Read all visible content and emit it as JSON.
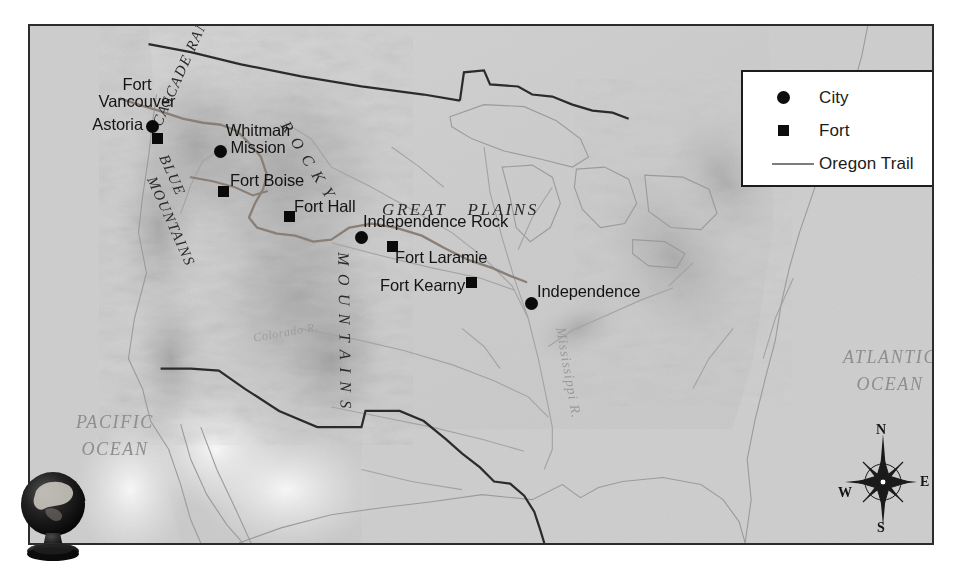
{
  "map": {
    "title": "Oregon Trail Map",
    "background_color": "#cfcfcf",
    "border_color": "#2c2c2c",
    "trail_color": "#8a7f74",
    "boundary_color": "#2b2b2b"
  },
  "legend": {
    "title": "Map Legend",
    "border_color": "#1c1c1c",
    "items": [
      {
        "symbol": "city-dot-icon",
        "label": "City"
      },
      {
        "symbol": "fort-square-icon",
        "label": "Fort"
      },
      {
        "symbol": "trail-line-icon",
        "label": "Oregon Trail"
      }
    ]
  },
  "places": [
    {
      "name": "Fort Vancouver",
      "type": "fort",
      "label": "Fort\nVancouver",
      "label_x": 62,
      "label_y": 50,
      "label_w": 90,
      "label_align": "c",
      "marker_x": 122,
      "marker_y": 107
    },
    {
      "name": "Astoria",
      "type": "city",
      "label": "Astoria",
      "label_x": 47,
      "label_y": 90,
      "label_w": 66,
      "label_align": "r",
      "marker_x": 116,
      "marker_y": 94
    },
    {
      "name": "Whitman Mission",
      "type": "city",
      "label": "Whitman\nMission",
      "label_x": 188,
      "label_y": 96,
      "label_w": 80,
      "label_align": "c",
      "marker_x": 184,
      "marker_y": 119
    },
    {
      "name": "Fort Boise",
      "type": "fort",
      "label": "Fort Boise",
      "label_x": 200,
      "label_y": 146,
      "label_w": 86,
      "label_align": "l",
      "marker_x": 188,
      "marker_y": 160
    },
    {
      "name": "Fort Hall",
      "type": "fort",
      "label": "Fort Hall",
      "label_x": 264,
      "label_y": 172,
      "label_w": 76,
      "label_align": "l",
      "marker_x": 254,
      "marker_y": 185
    },
    {
      "name": "Independence Rock",
      "type": "city",
      "label": "Independence Rock",
      "label_x": 333,
      "label_y": 187,
      "label_w": 162,
      "label_align": "l",
      "marker_x": 325,
      "marker_y": 205
    },
    {
      "name": "Fort Laramie",
      "type": "fort",
      "label": "Fort Laramie",
      "label_x": 365,
      "label_y": 223,
      "label_w": 106,
      "label_align": "l",
      "marker_x": 357,
      "marker_y": 215
    },
    {
      "name": "Fort Kearny",
      "type": "fort",
      "label": "Fort Kearny",
      "label_x": 350,
      "label_y": 251,
      "label_w": 98,
      "label_align": "l",
      "marker_x": 436,
      "marker_y": 251
    },
    {
      "name": "Independence",
      "type": "city",
      "label": "Independence",
      "label_x": 507,
      "label_y": 257,
      "label_w": 118,
      "label_align": "l",
      "marker_x": 495,
      "marker_y": 271
    }
  ],
  "regions": {
    "great_plains": "GREAT   PLAINS",
    "rocky": "R O C K Y",
    "mountains": "M O U N T A I N S",
    "cascade_range": "CASCADE RANGE",
    "blue": "BLUE",
    "blue_mountains": "MOUNTAINS",
    "pacific_ocean": "PACIFIC\nOCEAN",
    "atlantic_ocean": "ATLANTIC\nOCEAN",
    "mississippi_river": "Mississippi R.",
    "columbia_river": "Colorado R."
  },
  "compass": {
    "north": "N",
    "east": "E",
    "south": "S",
    "west": "W"
  },
  "globe": {
    "label": "desk-globe"
  }
}
